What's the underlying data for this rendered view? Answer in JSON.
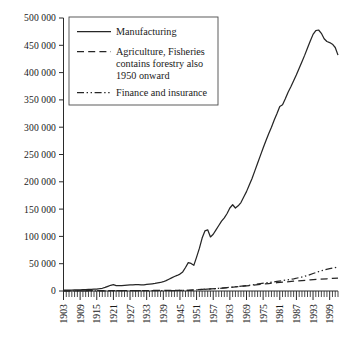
{
  "chart_data": {
    "type": "line",
    "title": "",
    "xlabel": "",
    "ylabel": "",
    "xlim": [
      1903,
      2002
    ],
    "ylim": [
      0,
      500000
    ],
    "grid": false,
    "legend_position": "top-left",
    "ytick_labels": [
      "0",
      "50 000",
      "100 000",
      "150 000",
      "200 000",
      "250 000",
      "300 000",
      "350 000",
      "400 000",
      "450 000",
      "500 000"
    ],
    "ytick_values": [
      0,
      50000,
      100000,
      150000,
      200000,
      250000,
      300000,
      350000,
      400000,
      450000,
      500000
    ],
    "xtick_labels": [
      "1903",
      "1909",
      "1915",
      "1921",
      "1927",
      "1933",
      "1939",
      "1945",
      "1951",
      "1957",
      "1963",
      "1969",
      "1975",
      "1981",
      "1987",
      "1993",
      "1999"
    ],
    "xtick_values": [
      1903,
      1909,
      1915,
      1921,
      1927,
      1933,
      1939,
      1945,
      1951,
      1957,
      1963,
      1969,
      1975,
      1981,
      1987,
      1993,
      1999
    ],
    "minor_tick_interval": 1,
    "series": [
      {
        "name": "Manufacturing",
        "style": "solid",
        "legend_label": "Manufacturing",
        "x": [
          1903,
          1904,
          1905,
          1906,
          1907,
          1908,
          1909,
          1910,
          1911,
          1912,
          1913,
          1914,
          1915,
          1916,
          1917,
          1918,
          1919,
          1920,
          1921,
          1922,
          1923,
          1924,
          1925,
          1926,
          1927,
          1928,
          1929,
          1930,
          1931,
          1932,
          1933,
          1934,
          1935,
          1936,
          1937,
          1938,
          1939,
          1940,
          1941,
          1942,
          1943,
          1944,
          1945,
          1946,
          1947,
          1948,
          1949,
          1950,
          1951,
          1952,
          1953,
          1954,
          1955,
          1956,
          1957,
          1958,
          1959,
          1960,
          1961,
          1962,
          1963,
          1964,
          1965,
          1966,
          1967,
          1968,
          1969,
          1970,
          1971,
          1972,
          1973,
          1974,
          1975,
          1976,
          1977,
          1978,
          1979,
          1980,
          1981,
          1982,
          1983,
          1984,
          1985,
          1986,
          1987,
          1988,
          1989,
          1990,
          1991,
          1992,
          1993,
          1994,
          1995,
          1996,
          1997,
          1998,
          1999,
          2000,
          2001,
          2002
        ],
        "y": [
          1500,
          1600,
          1700,
          1800,
          2000,
          2100,
          2200,
          2400,
          2600,
          2800,
          3100,
          3300,
          3600,
          4200,
          5000,
          6500,
          8500,
          10500,
          11500,
          10000,
          9800,
          9900,
          10200,
          10600,
          11000,
          11400,
          11800,
          11600,
          11200,
          11400,
          12000,
          12600,
          13200,
          13900,
          14800,
          15600,
          17000,
          19000,
          21500,
          24000,
          26500,
          28500,
          31000,
          35000,
          43000,
          52000,
          50500,
          47000,
          62000,
          78000,
          97000,
          110000,
          112000,
          99000,
          104000,
          112000,
          120000,
          128000,
          134000,
          142000,
          152000,
          158000,
          152000,
          156000,
          162000,
          172000,
          182000,
          194000,
          206000,
          220000,
          234000,
          248000,
          262000,
          275000,
          288000,
          300000,
          313000,
          325000,
          338000,
          341000,
          352000,
          364000,
          374000,
          385000,
          396000,
          408000,
          420000,
          432000,
          445000,
          458000,
          470000,
          477000,
          478000,
          472000,
          462000,
          457000,
          455000,
          452000,
          446000,
          432000
        ]
      },
      {
        "name": "Agriculture, Fisheries",
        "style": "dashed",
        "legend_label": "Agriculture, Fisheries contains forestry also 1950 onward",
        "legend_label_lines": [
          "Agriculture, Fisheries",
          "contains forestry also",
          "1950 onward"
        ],
        "x": [
          1903,
          1908,
          1913,
          1918,
          1923,
          1928,
          1933,
          1938,
          1943,
          1948,
          1950,
          1953,
          1956,
          1959,
          1962,
          1965,
          1968,
          1971,
          1974,
          1977,
          1980,
          1983,
          1986,
          1989,
          1992,
          1995,
          1998,
          2000,
          2002
        ],
        "y": [
          400,
          450,
          500,
          600,
          700,
          800,
          900,
          1000,
          1100,
          1300,
          2000,
          3000,
          3800,
          4800,
          6000,
          7400,
          8800,
          10400,
          12200,
          13600,
          15200,
          16600,
          18000,
          19200,
          20400,
          21400,
          22400,
          23000,
          23600
        ]
      },
      {
        "name": "Finance and insurance",
        "style": "dash-dot-dot",
        "legend_label": "Finance and insurance",
        "x": [
          1903,
          1908,
          1913,
          1918,
          1923,
          1928,
          1933,
          1938,
          1943,
          1948,
          1950,
          1953,
          1956,
          1959,
          1962,
          1965,
          1968,
          1971,
          1974,
          1977,
          1980,
          1983,
          1986,
          1989,
          1991,
          1993,
          1995,
          1997,
          1999,
          2001,
          2002
        ],
        "y": [
          200,
          250,
          300,
          400,
          500,
          600,
          700,
          800,
          900,
          1100,
          1800,
          2900,
          3900,
          5000,
          6300,
          7800,
          9400,
          11200,
          13400,
          15400,
          17600,
          19800,
          22400,
          25600,
          28400,
          32000,
          35400,
          38600,
          41000,
          43000,
          44200
        ]
      }
    ]
  },
  "legend": {
    "entries": [
      {
        "label": "Manufacturing",
        "style": "solid"
      },
      {
        "label_line1": "Agriculture, Fisheries",
        "label_line2": "contains forestry also",
        "label_line3": "1950 onward",
        "style": "dashed"
      },
      {
        "label": "Finance and insurance",
        "style": "dash-dot-dot"
      }
    ]
  }
}
